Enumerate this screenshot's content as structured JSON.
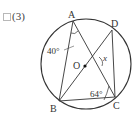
{
  "problem": {
    "number_label": "(3)",
    "checkbox": "unchecked"
  },
  "figure": {
    "points": {
      "A": {
        "label": "A",
        "x": 73,
        "y": 21
      },
      "B": {
        "label": "B",
        "x": 59,
        "y": 101
      },
      "C": {
        "label": "C",
        "x": 115,
        "y": 97
      },
      "D": {
        "label": "D",
        "x": 112,
        "y": 30
      },
      "O": {
        "label": "O",
        "x": 85,
        "y": 66
      }
    },
    "circle": {
      "cx": 86,
      "cy": 64,
      "r": 45
    },
    "angles": {
      "angle_BAC": "40°",
      "angle_ACB": "64°",
      "unknown": "x"
    },
    "segments": [
      "AB",
      "AC",
      "BD",
      "DC",
      "BC"
    ]
  }
}
